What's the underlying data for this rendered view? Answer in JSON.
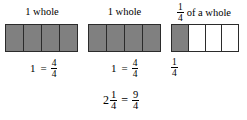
{
  "diagram": {
    "type": "fraction-bar-model",
    "background_color": "#ffffff",
    "shaded_color": "#808080",
    "line_color": "#2b2b2b",
    "groups": [
      {
        "heading": "1 whole",
        "bar": {
          "total_parts": 4,
          "shaded_parts": 4
        },
        "label": {
          "whole": "1",
          "operator": "=",
          "numerator": "4",
          "denominator": "4"
        }
      },
      {
        "heading": "1 whole",
        "bar": {
          "total_parts": 4,
          "shaded_parts": 4
        },
        "label": {
          "whole": "1",
          "operator": "=",
          "numerator": "4",
          "denominator": "4"
        }
      },
      {
        "heading_fraction": {
          "numerator": "1",
          "denominator": "4"
        },
        "heading_text": "of a whole",
        "bar": {
          "total_parts": 4,
          "shaded_parts": 1
        },
        "label": {
          "numerator": "1",
          "denominator": "4"
        }
      }
    ],
    "total_equation": {
      "mixed_whole": "2",
      "mixed_numerator": "1",
      "mixed_denominator": "4",
      "operator": "=",
      "improper_numerator": "9",
      "improper_denominator": "4"
    }
  }
}
